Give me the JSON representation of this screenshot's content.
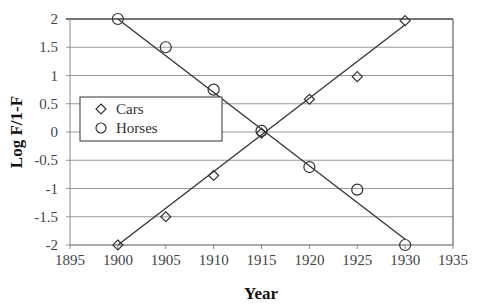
{
  "chart_data": {
    "type": "scatter",
    "title": "",
    "xlabel": "Year",
    "ylabel": "Log F/1-F",
    "xlim": [
      1895,
      1935
    ],
    "ylim": [
      -2,
      2
    ],
    "x_ticks": [
      1895,
      1900,
      1905,
      1910,
      1915,
      1920,
      1925,
      1930,
      1935
    ],
    "y_ticks": [
      2,
      1.5,
      1,
      0.5,
      0,
      -0.5,
      -1,
      -1.5,
      -2
    ],
    "y_tick_labels": [
      "2",
      "1.5",
      "1",
      "0.5",
      "0",
      "-0.5",
      "-1",
      "-1.5",
      "-2"
    ],
    "grid": "horizontal",
    "legend_position": "upper-left inside",
    "series": [
      {
        "name": "Cars",
        "marker": "diamond",
        "x": [
          1900,
          1905,
          1910,
          1915,
          1920,
          1925,
          1930
        ],
        "values": [
          -2,
          -1.5,
          -0.77,
          -0.02,
          0.58,
          0.98,
          1.97
        ],
        "trendline": {
          "x": [
            1900,
            1930
          ],
          "y": [
            -2,
            1.9
          ]
        }
      },
      {
        "name": "Horses",
        "marker": "circle",
        "x": [
          1900,
          1905,
          1910,
          1915,
          1920,
          1925,
          1930
        ],
        "values": [
          2,
          1.5,
          0.75,
          0.02,
          -0.62,
          -1.02,
          -2
        ],
        "trendline": {
          "x": [
            1900,
            1930
          ],
          "y": [
            2,
            -1.9
          ]
        }
      }
    ]
  },
  "legend": {
    "items": [
      {
        "label": "Cars",
        "marker": "diamond"
      },
      {
        "label": "Horses",
        "marker": "circle"
      }
    ]
  },
  "axes": {
    "x_title": "Year",
    "y_title": "Log F/1-F"
  },
  "colors": {
    "line": "#333333",
    "grid": "#999999",
    "marker_stroke": "#333333"
  }
}
